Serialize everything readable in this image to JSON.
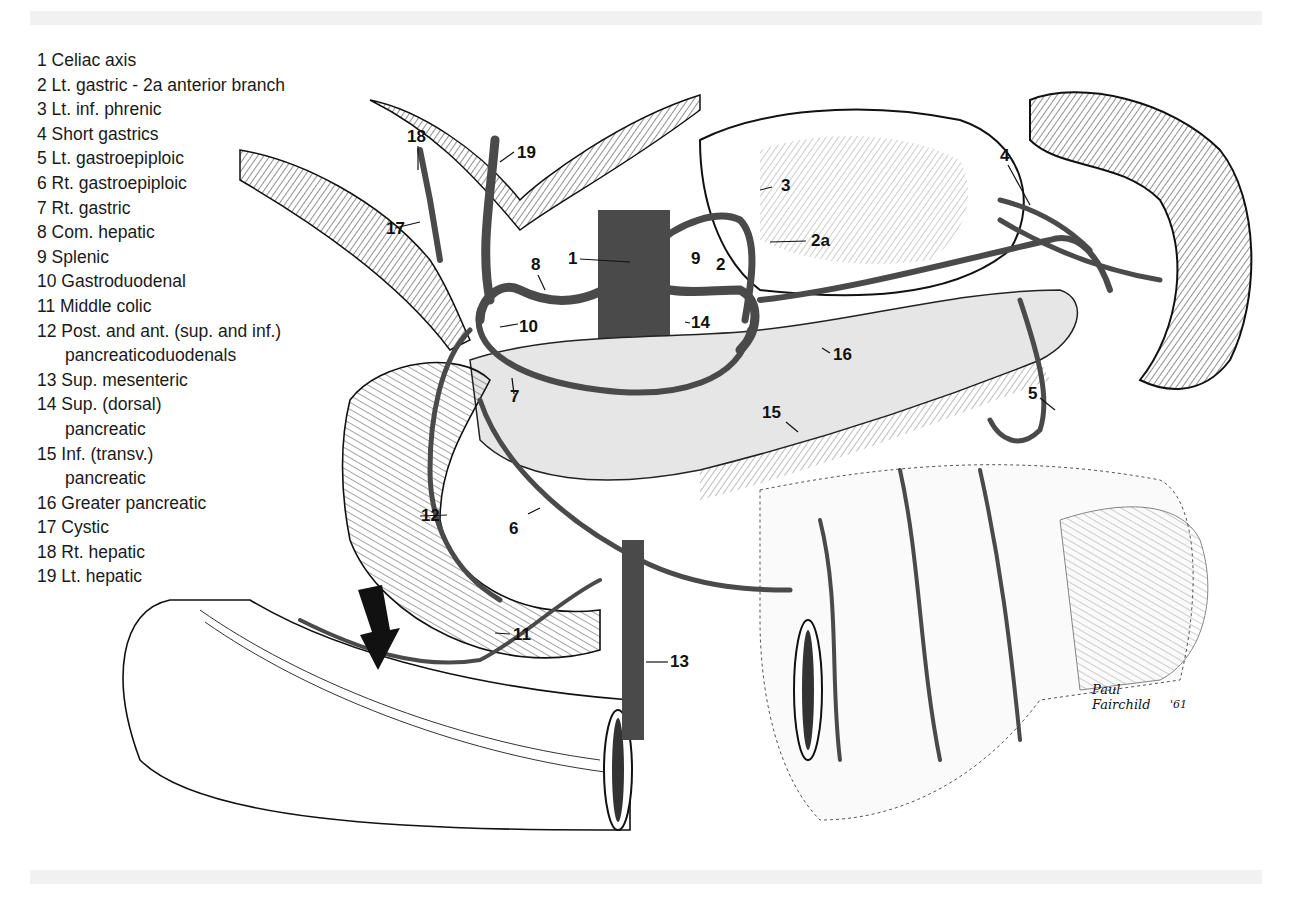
{
  "figure": {
    "type": "anatomical illustration"
  },
  "legend": [
    {
      "num": "1",
      "label": "Celiac axis"
    },
    {
      "num": "2",
      "label": "Lt. gastric - 2a anterior branch"
    },
    {
      "num": "3",
      "label": "Lt. inf. phrenic"
    },
    {
      "num": "4",
      "label": "Short gastrics"
    },
    {
      "num": "5",
      "label": "Lt. gastroepiploic"
    },
    {
      "num": "6",
      "label": "Rt. gastroepiploic"
    },
    {
      "num": "7",
      "label": "Rt. gastric"
    },
    {
      "num": "8",
      "label": "Com. hepatic"
    },
    {
      "num": "9",
      "label": "Splenic"
    },
    {
      "num": "10",
      "label": "Gastroduodenal"
    },
    {
      "num": "11",
      "label": "Middle colic"
    },
    {
      "num": "12",
      "label": "Post. and ant. (sup. and inf.)",
      "cont": "pancreaticoduodenals"
    },
    {
      "num": "13",
      "label": "Sup. mesenteric"
    },
    {
      "num": "14",
      "label": "Sup. (dorsal)",
      "cont": "pancreatic"
    },
    {
      "num": "15",
      "label": "Inf. (transv.)",
      "cont": "pancreatic"
    },
    {
      "num": "16",
      "label": "Greater pancreatic"
    },
    {
      "num": "17",
      "label": "Cystic"
    },
    {
      "num": "18",
      "label": "Rt. hepatic"
    },
    {
      "num": "19",
      "label": "Lt. hepatic"
    }
  ],
  "callouts": [
    {
      "text": "18",
      "x": 407,
      "y": 127
    },
    {
      "text": "19",
      "x": 517,
      "y": 143
    },
    {
      "text": "17",
      "x": 386,
      "y": 219
    },
    {
      "text": "3",
      "x": 781,
      "y": 176
    },
    {
      "text": "2a",
      "x": 811,
      "y": 231
    },
    {
      "text": "4",
      "x": 1000,
      "y": 146
    },
    {
      "text": "1",
      "x": 568,
      "y": 249
    },
    {
      "text": "8",
      "x": 531,
      "y": 255
    },
    {
      "text": "9",
      "x": 691,
      "y": 249
    },
    {
      "text": "2",
      "x": 716,
      "y": 255
    },
    {
      "text": "10",
      "x": 519,
      "y": 317
    },
    {
      "text": "14",
      "x": 691,
      "y": 313
    },
    {
      "text": "16",
      "x": 833,
      "y": 345
    },
    {
      "text": "7",
      "x": 510,
      "y": 387
    },
    {
      "text": "15",
      "x": 762,
      "y": 403
    },
    {
      "text": "5",
      "x": 1028,
      "y": 384
    },
    {
      "text": "12",
      "x": 421,
      "y": 506
    },
    {
      "text": "6",
      "x": 509,
      "y": 519
    },
    {
      "text": "11",
      "x": 513,
      "y": 625
    },
    {
      "text": "13",
      "x": 670,
      "y": 652
    }
  ],
  "signature": {
    "line1": "Paul",
    "line2": "Fairchild",
    "year": "'61"
  },
  "colors": {
    "background": "#ffffff",
    "ink": "#111111",
    "vessel": "#4a4a4a",
    "organ_shade": "#d9d9d9",
    "band": "#f1f1f1"
  }
}
